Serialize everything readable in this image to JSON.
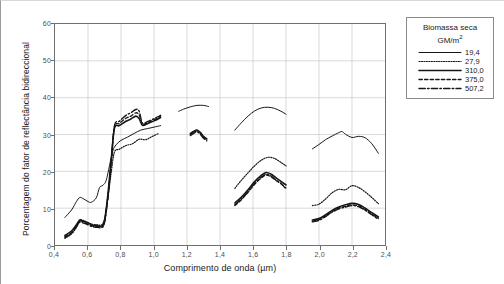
{
  "figure": {
    "y_axis_title": "Porcentagem do fator de reflectância bidireccional",
    "x_axis_title": "Comprimento de onda (µm)"
  },
  "legend": {
    "title_line1": "Biomassa seca",
    "title_line2_prefix": "GM/m",
    "title_line2_sup": "2",
    "entries": [
      {
        "label": "19,4",
        "style": "solid"
      },
      {
        "label": "27,9",
        "style": "dotted"
      },
      {
        "label": "310,0",
        "style": "solid"
      },
      {
        "label": "375,0",
        "style": "dashed"
      },
      {
        "label": "507,2",
        "style": "dashdot"
      }
    ]
  },
  "chart_data": {
    "type": "line",
    "title": "",
    "xlabel": "Comprimento de onda (µm)",
    "ylabel": "Porcentagem do fator de reflectância bidireccional",
    "xlim": [
      0.4,
      2.4
    ],
    "ylim": [
      0,
      60
    ],
    "xticks": [
      "0,4",
      "0,6",
      "0,8",
      "1,0",
      "1,2",
      "1,4",
      "1,6",
      "1,8",
      "2,0",
      "2,2",
      "2,4"
    ],
    "xtick_values": [
      0.4,
      0.6,
      0.8,
      1.0,
      1.2,
      1.4,
      1.6,
      1.8,
      2.0,
      2.2,
      2.4
    ],
    "yticks": [
      "0",
      "10",
      "20",
      "30",
      "40",
      "50",
      "60"
    ],
    "ytick_values": [
      0,
      10,
      20,
      30,
      40,
      50,
      60
    ],
    "grid": true,
    "legend_position": "outside-right",
    "legend_title": "Biomassa seca GM/m2",
    "series": [
      {
        "name": "19,4",
        "style": "solid",
        "width": 1.0,
        "segments": [
          {
            "x": [
              0.46,
              0.5,
              0.53,
              0.55,
              0.57,
              0.6,
              0.62,
              0.65,
              0.67,
              0.69,
              0.71,
              0.73,
              0.75,
              0.77,
              0.8,
              0.84,
              0.88,
              0.92,
              0.96,
              1.0,
              1.04
            ],
            "y": [
              7.5,
              9.5,
              11.8,
              12.9,
              12.6,
              11.8,
              11.6,
              12.8,
              15.6,
              16.2,
              17.5,
              21.5,
              25.5,
              27.2,
              28.4,
              29.3,
              30.3,
              31.2,
              31.6,
              32.0,
              32.4
            ]
          },
          {
            "x": [
              1.15,
              1.18,
              1.22,
              1.26,
              1.3,
              1.33
            ],
            "y": [
              36.3,
              36.9,
              37.5,
              37.9,
              37.9,
              37.6
            ]
          },
          {
            "x": [
              1.49,
              1.53,
              1.57,
              1.61,
              1.65,
              1.69,
              1.73,
              1.77,
              1.8
            ],
            "y": [
              31.2,
              33.2,
              35.0,
              36.4,
              37.2,
              37.4,
              37.1,
              36.3,
              35.5
            ]
          },
          {
            "x": [
              1.96,
              2.0,
              2.04,
              2.08,
              2.12,
              2.14,
              2.16,
              2.2,
              2.24,
              2.28,
              2.32,
              2.36
            ],
            "y": [
              26.1,
              27.3,
              28.6,
              29.6,
              30.5,
              30.8,
              30.1,
              29.2,
              29.5,
              29.1,
              27.5,
              24.9
            ]
          }
        ]
      },
      {
        "name": "27,9",
        "style": "dotted",
        "width": 1.2,
        "segments": [
          {
            "x": [
              0.46,
              0.5,
              0.53,
              0.55,
              0.57,
              0.6,
              0.63,
              0.66,
              0.68,
              0.7,
              0.72,
              0.74,
              0.76,
              0.79,
              0.83,
              0.87,
              0.91,
              0.95,
              0.99,
              1.03
            ],
            "y": [
              1.8,
              3.0,
              4.8,
              6.6,
              6.7,
              6.1,
              5.6,
              5.5,
              5.4,
              7.0,
              12.5,
              19.5,
              25.2,
              26.0,
              27.0,
              27.5,
              28.7,
              28.6,
              29.5,
              30.3
            ]
          },
          {
            "x": [
              1.49,
              1.53,
              1.57,
              1.61,
              1.65,
              1.69,
              1.73,
              1.77,
              1.8
            ],
            "y": [
              15.4,
              17.6,
              19.6,
              21.5,
              23.0,
              23.8,
              23.5,
              22.4,
              21.5
            ]
          },
          {
            "x": [
              1.96,
              2.0,
              2.04,
              2.08,
              2.12,
              2.16,
              2.2,
              2.24,
              2.28,
              2.32,
              2.36
            ],
            "y": [
              10.7,
              11.1,
              12.5,
              14.2,
              15.1,
              15.0,
              16.1,
              15.6,
              14.4,
              12.9,
              11.2
            ]
          }
        ]
      },
      {
        "name": "310,0",
        "style": "solid",
        "width": 1.6,
        "segments": [
          {
            "x": [
              0.46,
              0.5,
              0.53,
              0.55,
              0.57,
              0.6,
              0.63,
              0.66,
              0.68,
              0.7,
              0.72,
              0.74,
              0.76,
              0.79,
              0.83,
              0.86,
              0.89,
              0.91,
              0.93,
              0.96,
              1.0,
              1.04
            ],
            "y": [
              2.6,
              3.8,
              5.5,
              6.8,
              6.5,
              6.0,
              5.3,
              5.2,
              5.1,
              6.6,
              13.5,
              22.8,
              31.6,
              32.4,
              33.6,
              34.2,
              35.0,
              34.3,
              32.5,
              32.9,
              33.7,
              34.6
            ]
          },
          {
            "x": [
              1.22,
              1.24,
              1.26,
              1.28,
              1.3,
              1.32
            ],
            "y": [
              30.3,
              30.8,
              31.2,
              30.6,
              29.5,
              28.8
            ]
          },
          {
            "x": [
              1.49,
              1.53,
              1.57,
              1.61,
              1.65,
              1.68,
              1.71,
              1.74,
              1.77,
              1.8
            ],
            "y": [
              11.4,
              13.0,
              15.0,
              17.2,
              18.9,
              19.7,
              19.2,
              18.2,
              17.3,
              16.3
            ]
          },
          {
            "x": [
              1.96,
              2.0,
              2.04,
              2.08,
              2.12,
              2.16,
              2.2,
              2.24,
              2.28,
              2.32,
              2.36
            ],
            "y": [
              6.8,
              7.2,
              8.2,
              9.4,
              10.3,
              10.9,
              11.3,
              11.0,
              10.0,
              8.8,
              7.6
            ]
          }
        ]
      },
      {
        "name": "375,0",
        "style": "dashed",
        "width": 1.3,
        "segments": [
          {
            "x": [
              0.46,
              0.5,
              0.53,
              0.55,
              0.57,
              0.6,
              0.63,
              0.66,
              0.68,
              0.7,
              0.72,
              0.74,
              0.76,
              0.79,
              0.83,
              0.86,
              0.89,
              0.91,
              0.93,
              0.96,
              1.0,
              1.04
            ],
            "y": [
              2.3,
              3.4,
              5.2,
              6.5,
              6.3,
              5.7,
              5.1,
              5.0,
              4.9,
              6.3,
              13.0,
              22.2,
              31.9,
              33.0,
              34.4,
              35.0,
              35.9,
              35.3,
              32.8,
              33.2,
              34.0,
              35.0
            ]
          },
          {
            "x": [
              1.22,
              1.24,
              1.26,
              1.28,
              1.3,
              1.32
            ],
            "y": [
              30.0,
              30.6,
              31.0,
              30.4,
              29.3,
              28.6
            ]
          },
          {
            "x": [
              1.49,
              1.53,
              1.57,
              1.61,
              1.65,
              1.68,
              1.71,
              1.74,
              1.77,
              1.8
            ],
            "y": [
              10.7,
              12.3,
              14.3,
              16.5,
              18.2,
              19.0,
              18.5,
              17.5,
              16.6,
              15.5
            ]
          },
          {
            "x": [
              1.96,
              2.0,
              2.04,
              2.08,
              2.12,
              2.16,
              2.2,
              2.24,
              2.28,
              2.32,
              2.36
            ],
            "y": [
              6.5,
              6.9,
              7.9,
              9.1,
              10.0,
              10.5,
              10.9,
              10.6,
              9.6,
              8.4,
              7.2
            ]
          }
        ]
      },
      {
        "name": "507,2",
        "style": "dashdot",
        "width": 1.4,
        "segments": [
          {
            "x": [
              0.46,
              0.5,
              0.53,
              0.55,
              0.57,
              0.6,
              0.63,
              0.66,
              0.68,
              0.7,
              0.72,
              0.74,
              0.76,
              0.79,
              0.83,
              0.86,
              0.89,
              0.91,
              0.93,
              0.96,
              1.0,
              1.04
            ],
            "y": [
              2.0,
              3.2,
              5.0,
              6.2,
              6.0,
              5.5,
              4.9,
              4.8,
              4.7,
              6.0,
              12.6,
              21.8,
              32.3,
              33.6,
              35.2,
              35.9,
              36.8,
              36.3,
              33.1,
              33.5,
              34.3,
              35.2
            ]
          },
          {
            "x": [
              1.22,
              1.24,
              1.26,
              1.28,
              1.3,
              1.32
            ],
            "y": [
              29.7,
              30.3,
              30.7,
              30.1,
              29.0,
              28.3
            ]
          },
          {
            "x": [
              1.49,
              1.53,
              1.57,
              1.61,
              1.65,
              1.68,
              1.71,
              1.74,
              1.77,
              1.8
            ],
            "y": [
              10.9,
              12.5,
              14.5,
              16.7,
              18.4,
              19.2,
              18.7,
              17.6,
              16.7,
              15.2
            ]
          },
          {
            "x": [
              1.96,
              2.0,
              2.04,
              2.08,
              2.12,
              2.16,
              2.2,
              2.24,
              2.28,
              2.32,
              2.36
            ],
            "y": [
              6.3,
              6.7,
              7.7,
              8.9,
              9.8,
              10.3,
              10.7,
              10.4,
              9.4,
              8.2,
              7.0
            ]
          }
        ]
      }
    ]
  }
}
